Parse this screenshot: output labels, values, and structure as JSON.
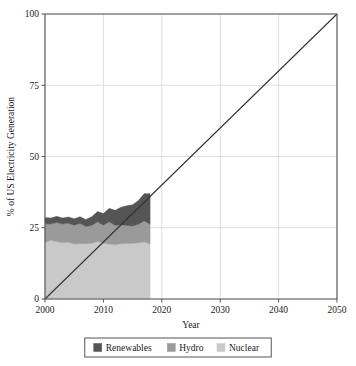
{
  "chart_data": {
    "type": "area",
    "title": "",
    "subtitle": "",
    "xlabel": "Year",
    "ylabel": "% of US Electricity Generation",
    "xlim": [
      2000,
      2050
    ],
    "ylim": [
      0,
      100
    ],
    "xticks": [
      2000,
      2010,
      2020,
      2030,
      2040,
      2050
    ],
    "xtick_labels": [
      "2000",
      "2010",
      "2020",
      "2030",
      "2040",
      "2050"
    ],
    "yticks": [
      0,
      25,
      50,
      75,
      100
    ],
    "ytick_labels": [
      "0",
      "25",
      "50",
      "75",
      "100"
    ],
    "grid": true,
    "legend_position": "bottom",
    "stacked": true,
    "x": [
      2000,
      2001,
      2002,
      2003,
      2004,
      2005,
      2006,
      2007,
      2008,
      2009,
      2010,
      2011,
      2012,
      2013,
      2014,
      2015,
      2016,
      2017,
      2018
    ],
    "series": [
      {
        "name": "Nuclear",
        "color": "#c9c9c9",
        "values": [
          19.8,
          20.6,
          20.2,
          19.7,
          19.9,
          19.3,
          19.4,
          19.4,
          19.6,
          20.2,
          19.6,
          19.3,
          19.0,
          19.4,
          19.5,
          19.5,
          19.7,
          20.0,
          19.3
        ]
      },
      {
        "name": "Hydro",
        "color": "#9a9a9a",
        "values": [
          6.6,
          5.7,
          6.6,
          6.6,
          6.7,
          6.6,
          7.1,
          6.0,
          6.2,
          6.9,
          6.3,
          7.8,
          6.8,
          6.6,
          6.3,
          6.1,
          6.5,
          7.4,
          6.9
        ]
      },
      {
        "name": "Renewables",
        "color": "#555555",
        "values": [
          2.2,
          2.1,
          2.2,
          2.1,
          2.2,
          2.3,
          2.4,
          2.5,
          3.1,
          3.6,
          4.1,
          4.7,
          5.3,
          6.2,
          6.9,
          7.5,
          8.4,
          9.6,
          10.7
        ]
      }
    ],
    "reference_line": {
      "name": "100% by 2050 target",
      "color": "#333333",
      "points": [
        [
          2000,
          0
        ],
        [
          2050,
          100
        ]
      ]
    },
    "legend": [
      {
        "label": "Renewables",
        "color": "#555555"
      },
      {
        "label": "Hydro",
        "color": "#9a9a9a"
      },
      {
        "label": "Nuclear",
        "color": "#c9c9c9"
      }
    ]
  }
}
